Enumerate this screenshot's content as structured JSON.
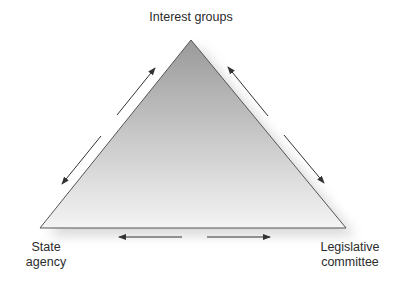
{
  "diagram": {
    "nodes": {
      "top": {
        "lines": [
          "Interest groups"
        ]
      },
      "left": {
        "lines": [
          "State",
          "agency"
        ]
      },
      "right": {
        "lines": [
          "Legislative",
          "committee"
        ]
      }
    },
    "edges": [
      {
        "between": [
          "State agency",
          "Interest groups"
        ],
        "direction": "bidirectional"
      },
      {
        "between": [
          "Interest groups",
          "Legislative committee"
        ],
        "direction": "bidirectional"
      },
      {
        "between": [
          "State agency",
          "Legislative committee"
        ],
        "direction": "bidirectional"
      }
    ],
    "colors": {
      "triangle_top": "#9a9a9a",
      "triangle_bottom": "#f4f4f4",
      "outline": "#555555",
      "arrow": "#333333"
    }
  }
}
